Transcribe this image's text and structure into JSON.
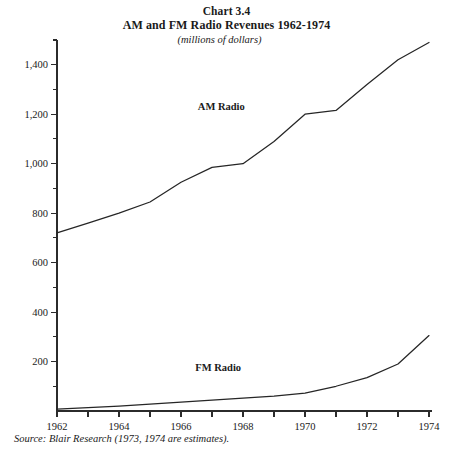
{
  "header": {
    "chart_number": "Chart 3.4",
    "title": "AM and FM Radio Revenues 1962-1974",
    "subtitle": "(millions of dollars)"
  },
  "footer": {
    "source_note": "Source: Blair Research (1973, 1974 are estimates)."
  },
  "chart_data": {
    "type": "line",
    "title": "AM and FM Radio Revenues 1962-1974",
    "subtitle": "(millions of dollars)",
    "xlabel": "",
    "ylabel": "",
    "xlim": [
      1962,
      1974
    ],
    "ylim": [
      0,
      1500
    ],
    "grid": false,
    "legend_position": "inline-labels",
    "x": [
      1962,
      1963,
      1964,
      1965,
      1966,
      1967,
      1968,
      1969,
      1970,
      1971,
      1972,
      1973,
      1974
    ],
    "x_tick_values": [
      1962,
      1963,
      1964,
      1965,
      1966,
      1967,
      1968,
      1969,
      1970,
      1971,
      1972,
      1973,
      1974
    ],
    "x_tick_labels": [
      "1962",
      "",
      "1964",
      "",
      "1966",
      "",
      "1968",
      "",
      "1970",
      "",
      "1972",
      "",
      "1974"
    ],
    "y_tick_major_values": [
      200,
      400,
      600,
      800,
      1000,
      1200,
      1400
    ],
    "y_tick_major_labels": [
      "200",
      "400",
      "600",
      "800",
      "1,000",
      "1,200",
      "1,400"
    ],
    "y_tick_minor_values": [
      100,
      300,
      500,
      700,
      900,
      1100,
      1300,
      1500
    ],
    "series": [
      {
        "name": "AM Radio",
        "label": "AM Radio",
        "label_x": 1967.3,
        "label_y": 1215,
        "color": "#262626",
        "values": [
          720,
          760,
          800,
          845,
          925,
          985,
          1000,
          1090,
          1200,
          1215,
          1320,
          1420,
          1490
        ]
      },
      {
        "name": "FM Radio",
        "label": "FM Radio",
        "label_x": 1967.2,
        "label_y": 160,
        "color": "#262626",
        "values": [
          8,
          14,
          20,
          28,
          36,
          44,
          52,
          60,
          72,
          100,
          135,
          190,
          305
        ]
      }
    ]
  }
}
